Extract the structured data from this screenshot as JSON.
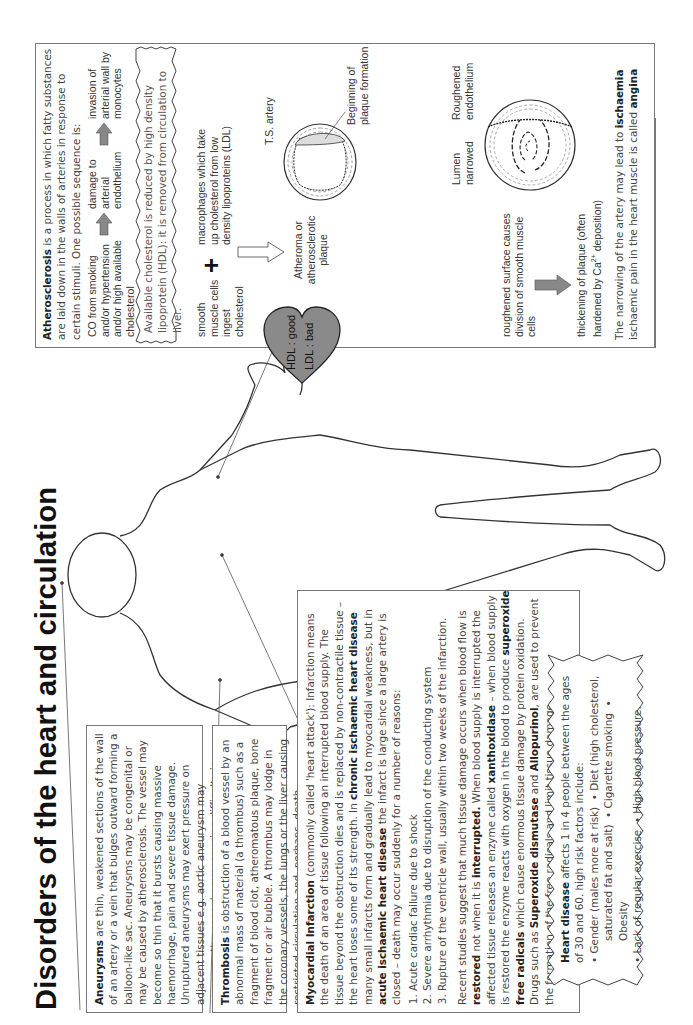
{
  "title": "Disorders of the heart and circulation",
  "aneurysms": {
    "term": "Aneurysms",
    "text": " are thin, weakened sections of the wall of an artery or a vein that bulges outward forming a balloon-like sac. Aneurysms may be congenital or may be caused by atherosclerosis. The vessel may become so thin that it bursts causing massive haemorrhage, pain and severe tissue damage. Unruptured aneurysms may exert pressure on adjacent tissues e.g. aortic aneurysm may compress the oesophagus, causing difficulty in swallowing."
  },
  "thrombosis": {
    "term": "Thrombosis",
    "text": " is obstruction of a blood vessel by an abnormal mass of material (a thrombus) such as a fragment of blood clot, atheromatous plaque, bone fragment or air bubble. A thrombus may lodge in the coronary vessels, the lungs or the liver causing restricted circulation and, perhaps, death."
  },
  "mi": {
    "term": "Myocardial Infarction",
    "t1": " (commonly called 'heart attack'): Infarction means the death of an area of tissue following an interrupted blood supply. The tissue beyond the obstruction dies and is replaced by non-contractile tissue – the heart loses some of its strength. In ",
    "b1": "chronic ischaemic heart disease",
    "t2": " many small infarcts form and gradually lead to myocardial weakness, but in ",
    "b2": "acute ischaemic heart disease",
    "t3": " the infarct is large since a large artery is closed – death may occur suddenly for a number of reasons:",
    "reasons": [
      "Acute cardiac failure due to shock",
      "Severe arrhythmia due to disruption of the conducting system",
      "Rupture of the ventricle wall, usually within two weeks of the infarction."
    ],
    "p2_1": "Recent studies suggest that much tissue damage occurs when blood flow is ",
    "p2_b1": "restored",
    "p2_2": " not when it is ",
    "p2_b2": "interrupted.",
    "p2_3": " When blood supply is interrupted the affected tissue releases an enzyme called ",
    "p2_b3": "xanthoxidase",
    "p2_4": " – when blood supply is restored the enzyme reacts with oxygen in the blood to produce ",
    "p2_b4": "superoxide free radicals",
    "p2_5": " which cause enormous tissue damage by protein oxidation. Drugs such as ",
    "p2_b5": "Superoxide dismutase",
    "p2_6": " and ",
    "p2_b6": "Allopurinol",
    "p2_7": ", are used to prevent the formation of the free radicals and limit tissue damage."
  },
  "heart_disease": {
    "term": "Heart disease",
    "text": " affects 1 in 4 people between the ages of 30 and 60. high risk factors include:",
    "line1a": "• Gender (males more at risk)",
    "line1b": "• Diet (high cholesterol,",
    "line2a": "saturated fat and salt)",
    "line2b": "• Cigarette smoking",
    "line2c": "• Obesity",
    "line3a": "• Lack of regular exercise",
    "line3b": "• High blood pressure."
  },
  "heart_label": {
    "hdl": "HDL : good",
    "ldl": "LDL : bad",
    "fill": "#8a8a8a"
  },
  "atherosclerosis": {
    "term": "Atherosclerosis",
    "text": " is a process in which fatty substances are laid down in the walls of arteries in response to certain stimuli. One possible sequence is:",
    "seq": [
      "CO from smoking and/or hypertension and/or high available cholesterol",
      "damage to arterial endothelium",
      "invasion of arterial wall by monocytes"
    ],
    "hdl_note": "Available cholesterol is reduced by high density lipoprotein (HDL): it is removed from circulation to liver.",
    "smooth": "smooth muscle cells ingest cholesterol",
    "plus": "+",
    "macro": "macrophages which take up cholesterol from low density lipoproteins (LDL)",
    "atheroma": "Atheroma or atherosclerotic plaque",
    "ts_artery": "T.S. artery",
    "beginning": "Beginning of plaque formation",
    "lumen": "Lumen narrowed",
    "roughened_endo": "Roughened endothelium",
    "roughened_surface": "roughened surface causes division of smooth muscle cells",
    "thickening": "thickening of plaque (often hardened by Ca",
    "thickening_sup": "2+",
    "thickening_end": " deposition)",
    "narrowing_1": "The narrowing of the artery may lead to ",
    "narrowing_b1": "ischaemia",
    "narrowing_2": "ischaemic pain in the heart muscle is called ",
    "narrowing_b2": "angina",
    "arrow_fill": "#888888"
  }
}
